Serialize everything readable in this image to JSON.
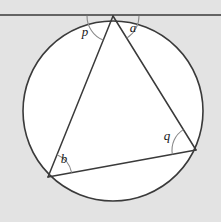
{
  "figure": {
    "canvas": {
      "width": 221,
      "height": 222
    },
    "colors": {
      "background": "#e3e3e3",
      "circle_fill": "#ffffff",
      "stroke": "#3a3a3a",
      "arc_stroke": "#8a8a8a",
      "label_color": "#1a1a1a"
    }
  },
  "circle": {
    "name": "circumcircle",
    "center_x": 113,
    "center_y": 111,
    "radius": 90
  },
  "tangent_line": {
    "name": "tangent",
    "y": 15,
    "x_start": 0,
    "x_end": 221
  },
  "vertices": {
    "apex": {
      "label": "T",
      "x": 113,
      "y": 16
    },
    "lower_left": {
      "label": "B",
      "x": 48,
      "y": 177
    },
    "right": {
      "label": "Q",
      "x": 196,
      "y": 150
    }
  },
  "chords": [
    {
      "name": "apex-to-lower-left",
      "x1": 113,
      "y1": 16,
      "x2": 48,
      "y2": 177
    },
    {
      "name": "apex-to-right",
      "x1": 113,
      "y1": 16,
      "x2": 196,
      "y2": 150
    },
    {
      "name": "lower-left-to-right",
      "x1": 48,
      "y1": 177,
      "x2": 196,
      "y2": 150
    }
  ],
  "angles": [
    {
      "id": "p",
      "label": "p",
      "vertex": "apex",
      "label_x": 85,
      "label_y": 36,
      "description": "angle between tangent (left ray) and chord from apex to lower-left vertex"
    },
    {
      "id": "a",
      "label": "a",
      "vertex": "apex",
      "label_x": 133,
      "label_y": 32,
      "description": "angle between chord from apex to right vertex and tangent (right ray)"
    },
    {
      "id": "b",
      "label": "b",
      "vertex": "lower_left",
      "label_x": 64,
      "label_y": 163,
      "description": "inscribed angle at lower-left vertex between chord to apex and chord to right vertex"
    },
    {
      "id": "q",
      "label": "q",
      "vertex": "right",
      "label_x": 167,
      "label_y": 140,
      "description": "inscribed angle at right vertex between chord to apex and chord to lower-left vertex"
    }
  ]
}
